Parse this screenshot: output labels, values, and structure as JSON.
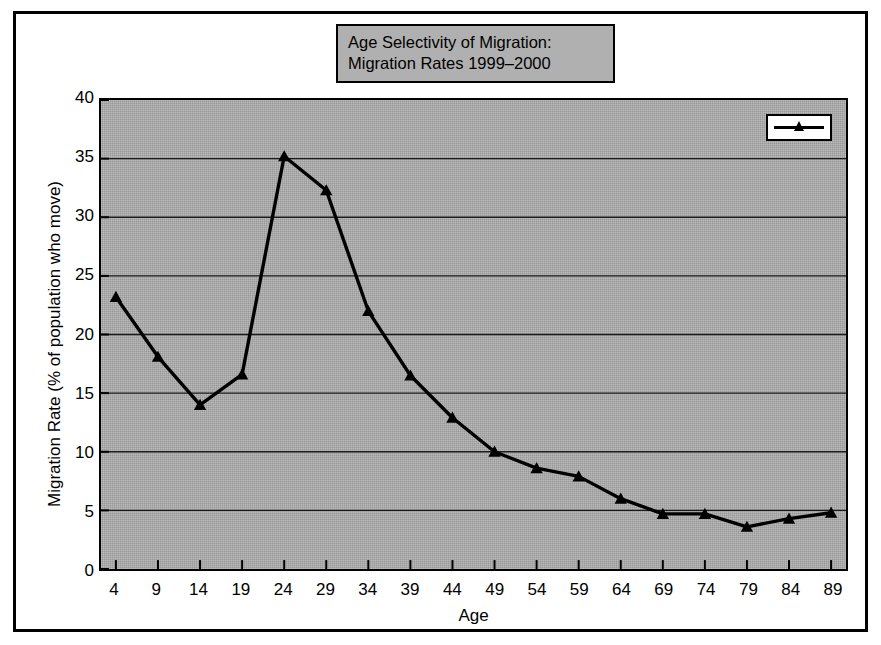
{
  "figure": {
    "background_color": "#ffffff",
    "frame_color": "#000000"
  },
  "title": {
    "line1": "Age Selectivity of Migration:",
    "line2": "Migration Rates 1999–2000",
    "box_fill": "#b0b0b0"
  },
  "chart_data": {
    "type": "line",
    "title": "Age Selectivity of Migration: Migration Rates 1999–2000",
    "xlabel": "Age",
    "ylabel": "Migration Rate (% of population who move)",
    "categories": [
      "4",
      "9",
      "14",
      "19",
      "24",
      "29",
      "34",
      "39",
      "44",
      "49",
      "54",
      "59",
      "64",
      "69",
      "74",
      "79",
      "84",
      "89"
    ],
    "values": [
      23.2,
      18.1,
      14.0,
      16.6,
      35.2,
      32.3,
      22.0,
      16.5,
      12.9,
      10.0,
      8.6,
      7.9,
      6.0,
      4.7,
      4.7,
      3.6,
      4.3,
      4.8
    ],
    "ylim": [
      0,
      40
    ],
    "yticks": [
      "0",
      "5",
      "10",
      "15",
      "20",
      "25",
      "30",
      "35",
      "40"
    ],
    "ytick_values": [
      0,
      5,
      10,
      15,
      20,
      25,
      30,
      35,
      40
    ],
    "grid": "horizontal",
    "plot_background": "#a9a9a9",
    "line_color": "#000000",
    "marker": "triangle",
    "legend_position": "top-right",
    "legend_label": ""
  }
}
